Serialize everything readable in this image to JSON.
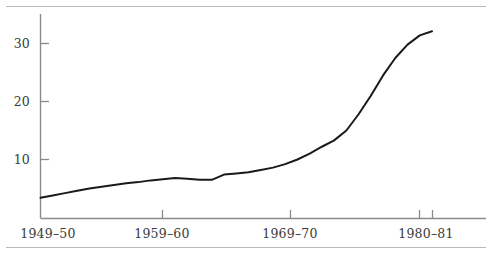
{
  "figure": {
    "background_color": "#ffffff",
    "rules": [
      {
        "name": "top-rule",
        "color": "#b8b8b8"
      },
      {
        "name": "bottom-rule",
        "color": "#b8b8b8"
      }
    ]
  },
  "axes": {
    "line_color": "#8a8a8a",
    "y_axis": {
      "tick_labels": [
        "30",
        "20",
        "10"
      ],
      "tick_values": [
        30,
        20,
        10
      ]
    },
    "x_axis": {
      "tick_labels": [
        "1949–50",
        "1959–60",
        "1969–70",
        "1980–81"
      ]
    }
  },
  "chart_data": {
    "type": "line",
    "title": "",
    "subtitle": "",
    "xlabel": "",
    "ylabel": "",
    "grid": false,
    "legend": "none",
    "line_color": "#1a1a1a",
    "line_width": 2.0,
    "xlim": [
      1949,
      1982
    ],
    "ylim": [
      0,
      35
    ],
    "yticks": [
      10,
      20,
      30
    ],
    "xticks": [
      1959,
      1969,
      1980,
      1981
    ],
    "xtick_labels": [
      "1959–60",
      "1969–70",
      "1980–81",
      ""
    ],
    "x": [
      1949,
      1950,
      1951,
      1952,
      1953,
      1954,
      1955,
      1956,
      1957,
      1958,
      1959,
      1960,
      1961,
      1962,
      1963,
      1964,
      1965,
      1966,
      1967,
      1968,
      1969,
      1970,
      1971,
      1972,
      1973,
      1974,
      1975,
      1976,
      1977,
      1978,
      1979,
      1980,
      1981
    ],
    "categories": [
      "1949–50",
      "1950–51",
      "1951–52",
      "1952–53",
      "1953–54",
      "1954–55",
      "1955–56",
      "1956–57",
      "1957–58",
      "1958–59",
      "1959–60",
      "1960–61",
      "1961–62",
      "1962–63",
      "1963–64",
      "1964–65",
      "1965–66",
      "1966–67",
      "1967–68",
      "1968–69",
      "1969–70",
      "1970–71",
      "1971–72",
      "1972–73",
      "1973–74",
      "1974–75",
      "1975–76",
      "1976–77",
      "1977–78",
      "1978–79",
      "1979–80",
      "1980–81",
      "1981–82"
    ],
    "values": [
      3.4,
      3.8,
      4.2,
      4.6,
      5.0,
      5.3,
      5.6,
      5.9,
      6.1,
      6.4,
      6.6,
      6.8,
      6.7,
      6.5,
      6.5,
      7.4,
      7.6,
      7.8,
      8.2,
      8.6,
      9.2,
      10.0,
      11.0,
      12.2,
      13.3,
      15.0,
      17.8,
      21.0,
      24.5,
      27.5,
      29.8,
      31.4,
      32.1
    ]
  }
}
